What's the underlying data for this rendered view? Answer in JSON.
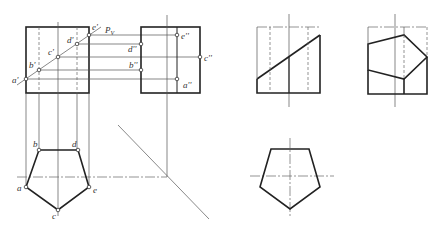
{
  "figure": {
    "front_view": {
      "box": {
        "x1": 26,
        "y1": 27,
        "x2": 89,
        "y2": 93
      },
      "cut_plane_label": "P",
      "cut_plane_sub": "V",
      "points": [
        {
          "name": "a'",
          "x": 26,
          "y": 79
        },
        {
          "name": "b'",
          "x": 39,
          "y": 70
        },
        {
          "name": "c'",
          "x": 58,
          "y": 57
        },
        {
          "name": "d'",
          "x": 77,
          "y": 44
        },
        {
          "name": "e'",
          "x": 89,
          "y": 35
        }
      ]
    },
    "side_view": {
      "box": {
        "x1": 141,
        "y1": 27,
        "x2": 200,
        "y2": 93
      },
      "points": [
        {
          "name": "e''",
          "x": 177,
          "y": 35
        },
        {
          "name": "d''",
          "x": 141,
          "y": 44
        },
        {
          "name": "c''",
          "x": 200,
          "y": 57
        },
        {
          "name": "b''",
          "x": 141,
          "y": 70
        },
        {
          "name": "a''",
          "x": 177,
          "y": 79
        }
      ]
    },
    "top_view": {
      "points": [
        {
          "name": "a",
          "x": 26,
          "y": 187
        },
        {
          "name": "b",
          "x": 39,
          "y": 150
        },
        {
          "name": "c",
          "x": 58,
          "y": 210
        },
        {
          "name": "d",
          "x": 78,
          "y": 150
        },
        {
          "name": "e",
          "x": 89,
          "y": 187
        }
      ]
    },
    "labels": {
      "a1": "a'",
      "b1": "b'",
      "c1": "c'",
      "d1": "d'",
      "e1": "e'",
      "a2": "a''",
      "b2": "b''",
      "c2": "c''",
      "d2": "d''",
      "e2": "e''",
      "a": "a",
      "b": "b",
      "c": "c",
      "d": "d",
      "e": "e",
      "pv": "P",
      "pv_sub": "V"
    }
  }
}
